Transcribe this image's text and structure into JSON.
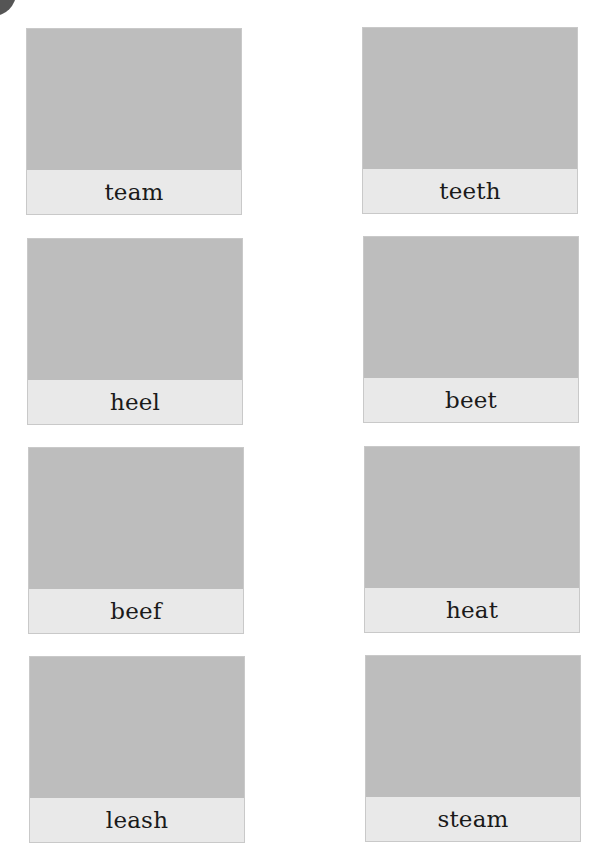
{
  "worksheet": {
    "cards": [
      {
        "word": "team",
        "column": "left",
        "row": 1
      },
      {
        "word": "teeth",
        "column": "right",
        "row": 1
      },
      {
        "word": "heel",
        "column": "left",
        "row": 2
      },
      {
        "word": "beet",
        "column": "right",
        "row": 2
      },
      {
        "word": "beef",
        "column": "left",
        "row": 3
      },
      {
        "word": "heat",
        "column": "right",
        "row": 3
      },
      {
        "word": "leash",
        "column": "left",
        "row": 4
      },
      {
        "word": "steam",
        "column": "right",
        "row": 4
      }
    ],
    "colors": {
      "picture_placeholder": "#bdbdbd",
      "label_background": "#e9e9e9",
      "card_border": "#c9c9c9",
      "text": "#1a1a1a",
      "corner_shape": "#555555"
    }
  }
}
